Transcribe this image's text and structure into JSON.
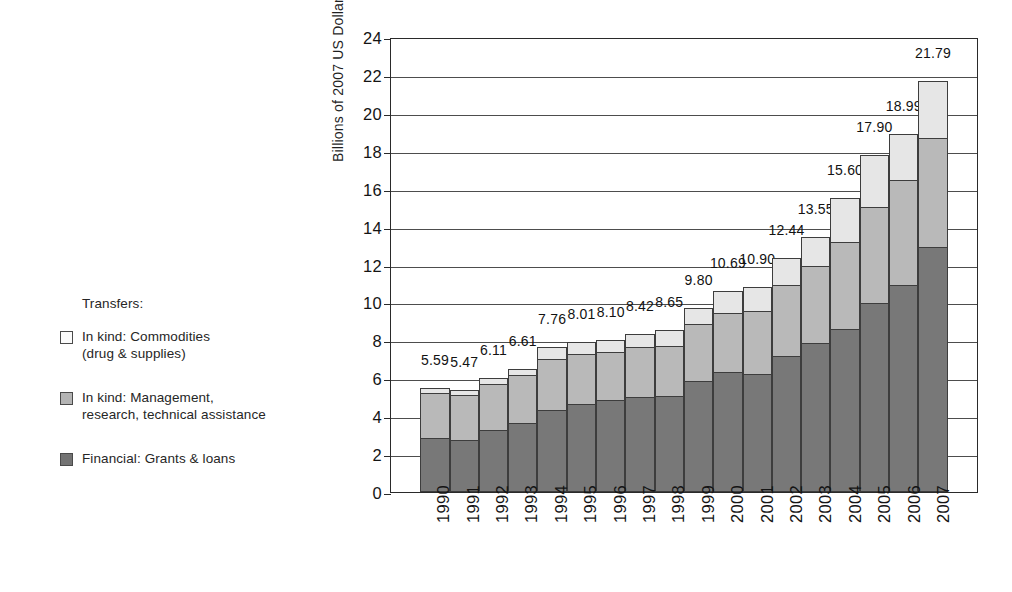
{
  "legend": {
    "title": "Transfers:",
    "items": [
      {
        "key": "commodities",
        "label_line1": "In kind: Commodities",
        "label_line2": "(drug & supplies)",
        "color": "#e6e6e6"
      },
      {
        "key": "management",
        "label_line1": "In kind: Management,",
        "label_line2": "research, technical assistance",
        "color": "#b9b9b9"
      },
      {
        "key": "financial",
        "label_line1": "Financial: Grants & loans",
        "label_line2": "",
        "color": "#787878"
      }
    ]
  },
  "chart_data": {
    "type": "bar",
    "subtype": "stacked-vertical",
    "title": "",
    "xlabel": "",
    "ylabel": "Billions of 2007 US Dollars",
    "ylim": [
      0,
      24
    ],
    "ytick_step": 2,
    "yticks": [
      "0",
      "2",
      "4",
      "6",
      "8",
      "10",
      "12",
      "14",
      "16",
      "18",
      "20",
      "22",
      "24"
    ],
    "grid": true,
    "legend_position": "left",
    "categories": [
      "1990",
      "1991",
      "1992",
      "1993",
      "1994",
      "1995",
      "1996",
      "1997",
      "1998",
      "1999",
      "2000",
      "2001",
      "2002",
      "2003",
      "2004",
      "2005",
      "2006",
      "2007"
    ],
    "series": [
      {
        "name": "Financial: Grants & loans",
        "color": "#787878",
        "values": [
          2.85,
          2.75,
          3.25,
          3.65,
          4.3,
          4.65,
          4.85,
          5.0,
          5.05,
          5.85,
          6.35,
          6.2,
          7.2,
          7.85,
          8.6,
          9.95,
          10.9,
          12.9
        ]
      },
      {
        "name": "In kind: Management, research, technical assistance",
        "color": "#b9b9b9",
        "values": [
          2.45,
          2.4,
          2.5,
          2.55,
          2.75,
          2.7,
          2.6,
          2.7,
          2.7,
          3.05,
          3.15,
          3.4,
          3.75,
          4.1,
          4.65,
          5.15,
          5.6,
          5.85
        ]
      },
      {
        "name": "In kind: Commodities (drug & supplies)",
        "color": "#e6e6e6",
        "values": [
          0.29,
          0.32,
          0.36,
          0.41,
          0.71,
          0.66,
          0.65,
          0.72,
          0.9,
          0.9,
          1.19,
          1.3,
          1.49,
          1.6,
          2.35,
          2.8,
          2.49,
          3.04
        ]
      }
    ],
    "totals": [
      5.59,
      5.47,
      6.11,
      6.61,
      7.76,
      8.01,
      8.1,
      8.42,
      8.65,
      9.8,
      10.69,
      10.9,
      12.44,
      13.55,
      15.6,
      17.9,
      18.99,
      21.79
    ],
    "value_labels": [
      "5.59",
      "5.47",
      "6.11",
      "6.61",
      "7.76",
      "8.01",
      "8.10",
      "8.42",
      "8.65",
      "9.80",
      "10.69",
      "10.90",
      "12.44",
      "13.55",
      "15.60",
      "17.90",
      "18.99",
      "21.79"
    ]
  }
}
